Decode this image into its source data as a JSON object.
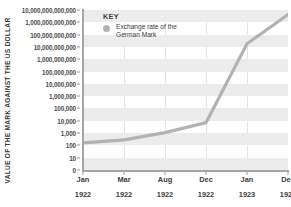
{
  "chart_data": {
    "type": "line",
    "title": "",
    "xlabel": "",
    "ylabel": "VALUE OF THE MARK AGAINST THE US DOLLAR",
    "yscale": "log",
    "grid": true,
    "legend_position": "top-left-inside",
    "y_tick_labels": [
      "10,000,000,000,000",
      "1,000,000,000,000",
      "100,000,000,000",
      "10,000,000,000",
      "1,000,000,000",
      "100,000,000",
      "10,000,000",
      "1,000,000",
      "100,000",
      "10,000",
      "1,000",
      "100",
      "10",
      "0"
    ],
    "y_tick_values": [
      10000000000000.0,
      1000000000000.0,
      100000000000.0,
      10000000000.0,
      1000000000.0,
      100000000.0,
      10000000.0,
      1000000.0,
      100000.0,
      10000.0,
      1000.0,
      100,
      10,
      0
    ],
    "x_tick_months": [
      "Jan",
      "Mar",
      "Aug",
      "Dec",
      "Jan",
      "Dec"
    ],
    "x_tick_years": [
      "1922",
      "1922",
      "1922",
      "1922",
      "1923",
      "1923"
    ],
    "categories": [
      "Jan 1922",
      "Mar 1922",
      "Aug 1922",
      "Dec 1922",
      "Jan 1923",
      "Dec 1923"
    ],
    "series": [
      {
        "name": "Exchange rate of the German Mark",
        "color": "#b2b2b2",
        "values": [
          160,
          280,
          1100,
          7000,
          18000000000,
          4200000000000
        ]
      }
    ]
  },
  "legend": {
    "title": "KEY",
    "entry_label": "Exchange rate of the German Mark",
    "swatch_color": "#b2b2b2",
    "swatch_icon": "circle-marker-icon"
  },
  "colors": {
    "line": "#b2b2b2",
    "band": "#ececec",
    "axis": "#a5a5a5",
    "text": "#3c3c3c",
    "background": "#ffffff"
  }
}
